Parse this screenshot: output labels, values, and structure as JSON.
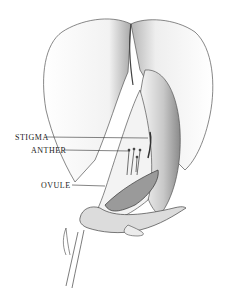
{
  "figure": {
    "labels": [
      {
        "text": "STIGMA",
        "x": 15,
        "y": 133
      },
      {
        "text": "ANTHER",
        "x": 31,
        "y": 146
      },
      {
        "text": "OVULE",
        "x": 41,
        "y": 181
      }
    ]
  }
}
